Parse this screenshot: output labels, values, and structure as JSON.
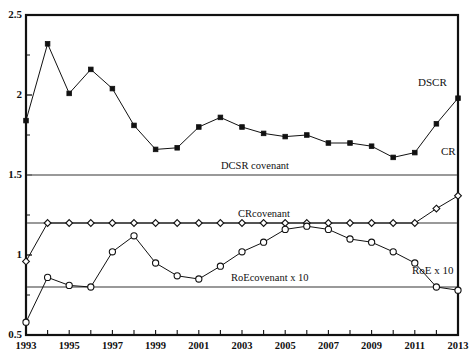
{
  "figure": {
    "cut_top_text": "Figure 6. Evolution of the credit ratios",
    "background": "#ffffff",
    "line_color": "#111111",
    "covenant_color": "#777777"
  },
  "axes": {
    "y": {
      "min": 0.5,
      "max": 2.5,
      "ticks": [
        0.5,
        1,
        1.5,
        2,
        2.5
      ],
      "tick_labels": [
        "0.5",
        "1",
        "1.5",
        "2",
        "2.5"
      ],
      "minor_ticks": [
        0.75,
        1.25,
        1.75,
        2.25
      ]
    },
    "x": {
      "min": 1993,
      "max": 2013,
      "ticks": [
        1993,
        1994,
        1995,
        1996,
        1997,
        1998,
        1999,
        2000,
        2001,
        2002,
        2003,
        2004,
        2005,
        2006,
        2007,
        2008,
        2009,
        2010,
        2011,
        2012,
        2013
      ],
      "tick_labels": [
        "1993",
        "",
        "1995",
        "",
        "1997",
        "",
        "1999",
        "",
        "2001",
        "",
        "2003",
        "",
        "2005",
        "",
        "2007",
        "",
        "2009",
        "",
        "2011",
        "",
        "2013"
      ]
    }
  },
  "annotations": {
    "dcsr_covenant_label": "DCSR covenant",
    "cr_covenant_label": "CRcovenant",
    "roe_covenant_label": "RoEcovenant x 10",
    "dscr_series_label": "DSCR",
    "cr_series_label": "CR",
    "roe_series_label": "RoE x 10"
  },
  "chart_data": {
    "type": "line",
    "title": "Figure 6. Evolution of the credit ratios",
    "xlabel": "",
    "ylabel": "",
    "xlim": [
      1993,
      2013
    ],
    "ylim": [
      0.5,
      2.5
    ],
    "grid": false,
    "legend": "inline-right",
    "x": [
      1993,
      1994,
      1995,
      1996,
      1997,
      1998,
      1999,
      2000,
      2001,
      2002,
      2003,
      2004,
      2005,
      2006,
      2007,
      2008,
      2009,
      2010,
      2011,
      2012,
      2013
    ],
    "series": [
      {
        "name": "DSCR",
        "marker": "filled-square",
        "values": [
          1.84,
          2.32,
          2.01,
          2.16,
          2.04,
          1.81,
          1.66,
          1.67,
          1.8,
          1.86,
          1.8,
          1.76,
          1.74,
          1.75,
          1.7,
          1.7,
          1.68,
          1.61,
          1.64,
          1.82,
          1.98
        ]
      },
      {
        "name": "CR",
        "marker": "open-diamond",
        "values": [
          0.96,
          1.2,
          1.2,
          1.2,
          1.2,
          1.2,
          1.2,
          1.2,
          1.2,
          1.2,
          1.2,
          1.2,
          1.2,
          1.2,
          1.2,
          1.2,
          1.2,
          1.2,
          1.2,
          1.29,
          1.37
        ]
      },
      {
        "name": "RoE x 10",
        "marker": "open-circle",
        "values": [
          0.58,
          0.86,
          0.81,
          0.8,
          1.02,
          1.12,
          0.95,
          0.87,
          0.85,
          0.93,
          1.02,
          1.08,
          1.16,
          1.18,
          1.16,
          1.1,
          1.08,
          1.02,
          0.95,
          0.8,
          0.78
        ]
      }
    ],
    "covenants": [
      {
        "name": "DCSR covenant",
        "value": 1.5
      },
      {
        "name": "CRcovenant",
        "value": 1.2
      },
      {
        "name": "RoEcovenant x 10",
        "value": 0.8
      }
    ]
  }
}
